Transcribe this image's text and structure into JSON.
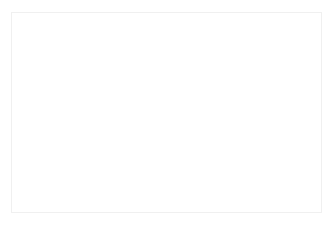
{
  "figure": {
    "title": "Dental implant cross-section",
    "caption": "Schematic sagittal cross-section of an endosseous dental implant placed in alveolar bone, with a crown restoration above the crestal bone level. Dashed reference lines mark the crestal bone plane and the implant long axis.",
    "background_color": "#ffffff",
    "frame_color": "#f0f0f0",
    "canvas": {
      "x": 11,
      "y": 12,
      "width": 311,
      "height": 201
    }
  },
  "palette": {
    "crown_enamel": "#ececec",
    "crown_shadow": "#e2e2e2",
    "crown_edge": "#e6e6e6",
    "cortical_bone": "#a0a0a0",
    "cancellous_bone": "#d8d8d8",
    "soft_tissue": "#d0d0d0",
    "implant_body": "#9e9e9e",
    "implant_abutment": "#b3b3b3",
    "thread_line": "#f2f2f2",
    "dashed_line": "#555555"
  },
  "parts": [
    {
      "id": "crown",
      "label": "Crown restoration",
      "color": "#ececec",
      "interactable": false
    },
    {
      "id": "crown-cervical-band",
      "label": "Cervical band of crown",
      "color": "#e2e2e2",
      "interactable": false
    },
    {
      "id": "abutment-collar",
      "label": "Abutment collar",
      "color": "#d8d8d8",
      "interactable": false
    },
    {
      "id": "cortical-bone-left",
      "label": "Cortical bone (left)",
      "color": "#a0a0a0",
      "interactable": false
    },
    {
      "id": "cortical-bone-right",
      "label": "Cortical bone (right)",
      "color": "#a0a0a0",
      "interactable": false
    },
    {
      "id": "cancellous-bone",
      "label": "Cancellous bone",
      "color": "#d8d8d8",
      "interactable": false
    },
    {
      "id": "implant-body",
      "label": "Implant fixture body",
      "color": "#9e9e9e",
      "interactable": false
    },
    {
      "id": "implant-threads",
      "label": "Implant threads",
      "color": "#f2f2f2",
      "interactable": false
    }
  ],
  "reference_lines": {
    "horizontal": {
      "id": "crestal-bone-line",
      "label": "Crestal bone level reference line",
      "orientation": "horizontal",
      "x1": 110,
      "x2": 196,
      "y": 134,
      "color": "#555555",
      "dash": "4 3",
      "width": 2
    },
    "vertical": {
      "id": "implant-axis-line",
      "label": "Implant long axis reference line",
      "orientation": "vertical",
      "x": 144,
      "y1": 103,
      "y2": 187,
      "color": "#555555",
      "dash": "4 3",
      "width": 2
    }
  },
  "threads": {
    "count": 8,
    "label": "Thread pitch lines",
    "color": "#f2f2f2",
    "stroke_width": 2.6,
    "rows_y": [
      160,
      167,
      174,
      181,
      188,
      195,
      202,
      209
    ]
  }
}
